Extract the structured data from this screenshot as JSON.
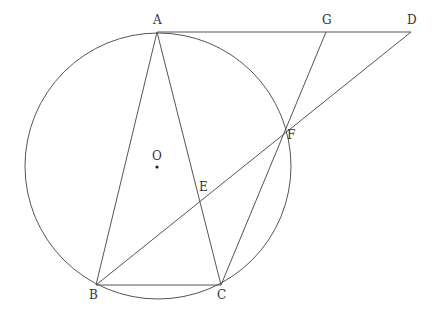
{
  "diagram": {
    "type": "geometry",
    "colors": {
      "stroke": "#555555",
      "label": "#333333",
      "background": "#ffffff"
    },
    "circle": {
      "name": "O",
      "cx": 158,
      "cy": 166,
      "r": 133
    },
    "points": {
      "A": {
        "label": "A",
        "x": 157,
        "y": 32,
        "lx": 153,
        "ly": 24
      },
      "B": {
        "label": "B",
        "x": 96,
        "y": 285,
        "lx": 89,
        "ly": 299
      },
      "C": {
        "label": "C",
        "x": 221,
        "y": 285,
        "lx": 217,
        "ly": 299
      },
      "D": {
        "label": "D",
        "x": 411,
        "y": 32,
        "lx": 407,
        "ly": 24
      },
      "G": {
        "label": "G",
        "x": 326,
        "y": 32,
        "lx": 322,
        "ly": 24
      },
      "F": {
        "label": "F",
        "x": 283,
        "y": 132,
        "lx": 287,
        "ly": 139
      },
      "E": {
        "label": "E",
        "x": 200,
        "y": 200,
        "lx": 199,
        "ly": 191
      },
      "O": {
        "label": "O",
        "x": 157,
        "y": 167,
        "lx": 152,
        "ly": 160
      }
    },
    "segments": [
      [
        "A",
        "D"
      ],
      [
        "A",
        "B"
      ],
      [
        "A",
        "C"
      ],
      [
        "B",
        "C"
      ],
      [
        "B",
        "D"
      ],
      [
        "C",
        "G"
      ]
    ]
  }
}
